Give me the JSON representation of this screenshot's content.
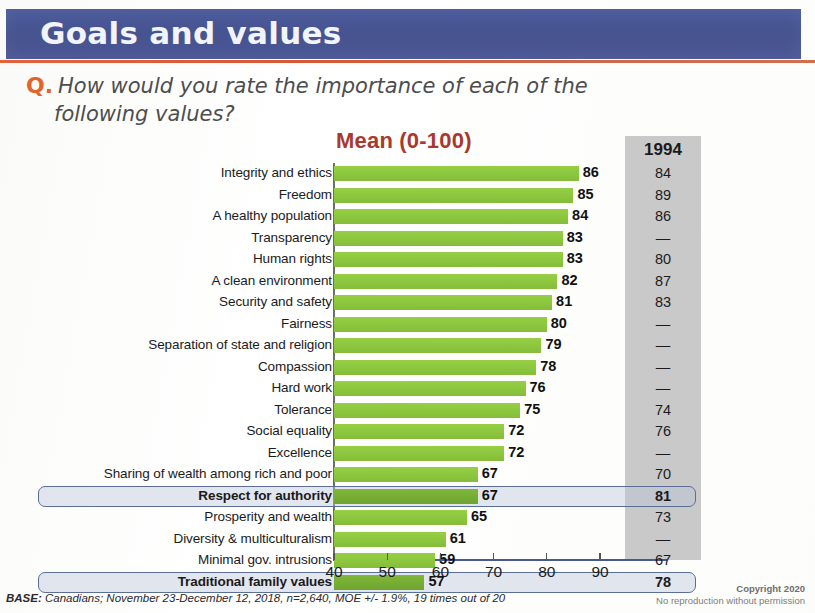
{
  "header": {
    "title": "Goals and values"
  },
  "question": {
    "marker": "Q.",
    "line1": "How would you rate the importance of each of the",
    "line2": "following values?"
  },
  "chart_heading": "Mean (0-100)",
  "column_1994_header": "1994",
  "footer": {
    "base_label": "BASE:",
    "base_text": "Canadians; November 23-December 12, 2018, n=2,640, MOE +/- 1.9%, 19 times out of 20",
    "copyright_line1": "Copyright 2020",
    "copyright_line2": "No reproduction without permission"
  },
  "colors": {
    "banner": "#4a5795",
    "banner_rule": "#d4491f",
    "bar": "#8dc63f",
    "bar_highlight": "#76ac33",
    "mean_title": "#a8392c",
    "q_marker": "#e2642c",
    "gray_column": "#c9c9c9",
    "highlight_border": "#5b6e96"
  },
  "chart_data": {
    "type": "bar",
    "title": "Mean (0-100)",
    "xlabel": "",
    "ylabel": "",
    "orientation": "horizontal",
    "xlim": [
      40,
      95
    ],
    "grid": false,
    "xticks": [
      40,
      50,
      60,
      70,
      80,
      90
    ],
    "categories": [
      "Integrity and ethics",
      "Freedom",
      "A healthy population",
      "Transparency",
      "Human rights",
      "A clean environment",
      "Security and safety",
      "Fairness",
      "Separation of state and religion",
      "Compassion",
      "Hard work",
      "Tolerance",
      "Social equality",
      "Excellence",
      "Sharing of wealth among rich and poor",
      "Respect for authority",
      "Prosperity and wealth",
      "Diversity & multiculturalism",
      "Minimal gov. intrusions",
      "Traditional family values"
    ],
    "series": [
      {
        "name": "2018 Mean (0-100)",
        "values": [
          86,
          85,
          84,
          83,
          83,
          82,
          81,
          80,
          79,
          78,
          76,
          75,
          72,
          72,
          67,
          67,
          65,
          61,
          59,
          57
        ]
      },
      {
        "name": "1994",
        "values": [
          "84",
          "89",
          "86",
          "—",
          "80",
          "87",
          "83",
          "—",
          "—",
          "—",
          "—",
          "74",
          "76",
          "—",
          "70",
          "81",
          "73",
          "—",
          "67",
          "78"
        ]
      }
    ],
    "highlighted_categories": [
      "Respect for authority",
      "Traditional family values"
    ],
    "legend_position": "none"
  }
}
